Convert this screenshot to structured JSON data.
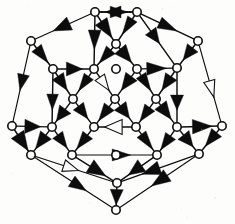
{
  "figure": {
    "kind": "directed-graph",
    "background_color": "#fdfdfc",
    "ink_color": "#0d0d0d",
    "node_fill": "#fdfdfc",
    "node_radius": 4.2,
    "edge_width": 1.45,
    "node_count": 26,
    "edge_count": 49,
    "nodes": [
      {
        "id": "n0",
        "x": 95,
        "y": 12
      },
      {
        "id": "n1",
        "x": 137,
        "y": 12
      },
      {
        "id": "n2",
        "x": 31,
        "y": 41
      },
      {
        "id": "n3",
        "x": 198,
        "y": 41
      },
      {
        "id": "n4",
        "x": 53,
        "y": 69
      },
      {
        "id": "n5",
        "x": 94,
        "y": 69
      },
      {
        "id": "n6",
        "x": 116,
        "y": 44
      },
      {
        "id": "n7",
        "x": 137,
        "y": 69
      },
      {
        "id": "n8",
        "x": 177,
        "y": 68
      },
      {
        "id": "n9",
        "x": 73,
        "y": 99
      },
      {
        "id": "n10",
        "x": 115,
        "y": 99
      },
      {
        "id": "n11",
        "x": 156,
        "y": 99
      },
      {
        "id": "n12",
        "x": 12,
        "y": 126
      },
      {
        "id": "n13",
        "x": 52,
        "y": 127
      },
      {
        "id": "n14",
        "x": 94,
        "y": 127
      },
      {
        "id": "n15",
        "x": 136,
        "y": 127
      },
      {
        "id": "n16",
        "x": 177,
        "y": 127
      },
      {
        "id": "n17",
        "x": 222,
        "y": 126
      },
      {
        "id": "n18",
        "x": 31,
        "y": 155
      },
      {
        "id": "n19",
        "x": 72,
        "y": 155
      },
      {
        "id": "n20",
        "x": 157,
        "y": 155
      },
      {
        "id": "n21",
        "x": 199,
        "y": 154
      },
      {
        "id": "n22",
        "x": 117,
        "y": 183
      },
      {
        "id": "n23",
        "x": 116,
        "y": 210
      },
      {
        "id": "n24",
        "x": 116,
        "y": 69
      },
      {
        "id": "n25",
        "x": 116,
        "y": 155
      }
    ],
    "edges": [
      {
        "from": "n0",
        "to": "n1",
        "arrow": "mid"
      },
      {
        "from": "n1",
        "to": "n0",
        "arrow": "mid"
      },
      {
        "from": "n0",
        "to": "n2",
        "arrow": "mid"
      },
      {
        "from": "n1",
        "to": "n3",
        "arrow": "mid"
      },
      {
        "from": "n2",
        "to": "n12",
        "arrow": "mid"
      },
      {
        "from": "n3",
        "to": "n17",
        "arrow": "mid"
      },
      {
        "from": "n0",
        "to": "n6",
        "arrow": "mid"
      },
      {
        "from": "n1",
        "to": "n6",
        "arrow": "mid"
      },
      {
        "from": "n0",
        "to": "n5",
        "arrow": "mid"
      },
      {
        "from": "n1",
        "to": "n8",
        "arrow": "mid"
      },
      {
        "from": "n2",
        "to": "n4",
        "arrow": "mid"
      },
      {
        "from": "n3",
        "to": "n8",
        "arrow": "mid"
      },
      {
        "from": "n6",
        "to": "n5",
        "arrow": "mid"
      },
      {
        "from": "n6",
        "to": "n7",
        "arrow": "mid"
      },
      {
        "from": "n4",
        "to": "n5",
        "arrow": "mid"
      },
      {
        "from": "n7",
        "to": "n8",
        "arrow": "mid"
      },
      {
        "from": "n4",
        "to": "n9",
        "arrow": "mid"
      },
      {
        "from": "n5",
        "to": "n9",
        "arrow": "mid"
      },
      {
        "from": "n5",
        "to": "n10",
        "arrow": "mid"
      },
      {
        "from": "n7",
        "to": "n10",
        "arrow": "mid"
      },
      {
        "from": "n7",
        "to": "n11",
        "arrow": "mid"
      },
      {
        "from": "n8",
        "to": "n11",
        "arrow": "mid"
      },
      {
        "from": "n4",
        "to": "n13",
        "arrow": "mid"
      },
      {
        "from": "n8",
        "to": "n16",
        "arrow": "mid"
      },
      {
        "from": "n9",
        "to": "n13",
        "arrow": "mid"
      },
      {
        "from": "n9",
        "to": "n14",
        "arrow": "mid"
      },
      {
        "from": "n10",
        "to": "n14",
        "arrow": "mid"
      },
      {
        "from": "n10",
        "to": "n15",
        "arrow": "mid"
      },
      {
        "from": "n11",
        "to": "n15",
        "arrow": "mid"
      },
      {
        "from": "n11",
        "to": "n16",
        "arrow": "mid"
      },
      {
        "from": "n12",
        "to": "n13",
        "arrow": "mid"
      },
      {
        "from": "n15",
        "to": "n14",
        "arrow": "mid"
      },
      {
        "from": "n16",
        "to": "n17",
        "arrow": "mid"
      },
      {
        "from": "n12",
        "to": "n18",
        "arrow": "mid"
      },
      {
        "from": "n17",
        "to": "n21",
        "arrow": "mid"
      },
      {
        "from": "n13",
        "to": "n18",
        "arrow": "mid"
      },
      {
        "from": "n13",
        "to": "n19",
        "arrow": "mid"
      },
      {
        "from": "n14",
        "to": "n19",
        "arrow": "mid"
      },
      {
        "from": "n15",
        "to": "n20",
        "arrow": "mid"
      },
      {
        "from": "n16",
        "to": "n20",
        "arrow": "mid"
      },
      {
        "from": "n16",
        "to": "n21",
        "arrow": "mid"
      },
      {
        "from": "n19",
        "to": "n20",
        "arrow": "mid"
      },
      {
        "from": "n19",
        "to": "n22",
        "arrow": "mid"
      },
      {
        "from": "n20",
        "to": "n22",
        "arrow": "mid"
      },
      {
        "from": "n18",
        "to": "n22",
        "arrow": "mid"
      },
      {
        "from": "n21",
        "to": "n22",
        "arrow": "mid"
      },
      {
        "from": "n18",
        "to": "n23",
        "arrow": "mid"
      },
      {
        "from": "n21",
        "to": "n23",
        "arrow": "mid"
      },
      {
        "from": "n22",
        "to": "n23",
        "arrow": "mid"
      }
    ]
  }
}
